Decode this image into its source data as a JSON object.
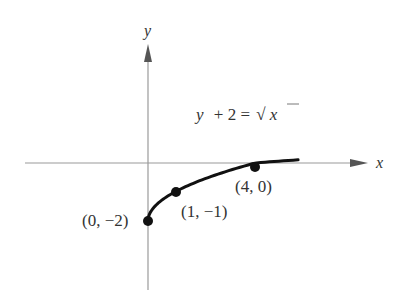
{
  "chart_data": {
    "type": "line",
    "title": "",
    "equation": "y + 2 = √x",
    "equation_parts": {
      "lhs_var": "y",
      "lhs_rest": "+ 2 =",
      "radical": "√",
      "radicand": "x"
    },
    "xlabel": "x",
    "ylabel": "y",
    "grid": false,
    "axis_ticks": false,
    "series": [
      {
        "name": "y = √x − 2",
        "x": [
          0,
          0.25,
          0.5,
          1,
          1.5,
          2,
          2.5,
          3,
          3.5,
          4,
          4.5,
          5,
          5.6
        ],
        "y": [
          -2,
          -1.5,
          -1.29,
          -1,
          -0.78,
          -0.59,
          -0.42,
          -0.27,
          -0.13,
          0,
          0.12,
          0.24,
          0.37
        ]
      }
    ],
    "points": [
      {
        "x": 0,
        "y": -2,
        "label": "(0, −2)"
      },
      {
        "x": 1,
        "y": -1,
        "label": "(1, −1)"
      },
      {
        "x": 4,
        "y": 0,
        "label": "(4, 0)"
      }
    ],
    "xlim": [
      -4.5,
      8.1
    ],
    "ylim": [
      -4.4,
      4.2
    ],
    "colors": {
      "curve": "#111111",
      "axes": "#999999",
      "arrow": "#555555",
      "text": "#333333"
    }
  }
}
